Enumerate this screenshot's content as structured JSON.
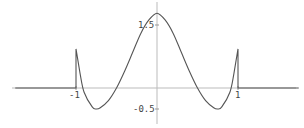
{
  "chart_data": {
    "type": "line",
    "title": "",
    "xlabel": "",
    "ylabel": "",
    "xlim": [
      -1.85,
      1.75
    ],
    "ylim": [
      -0.65,
      1.85
    ],
    "grid": false,
    "legend": null,
    "x_ticks": [
      {
        "value": -1,
        "label": "-1"
      },
      {
        "value": 1,
        "label": "1"
      }
    ],
    "y_ticks": [
      {
        "value": 1.5,
        "label": "1.5"
      },
      {
        "value": -0.5,
        "label": "-0.5"
      }
    ],
    "series": [
      {
        "name": "f(x)",
        "color": "#555555",
        "x": [
          -1.75,
          -1.0,
          -1.0,
          -0.95,
          -0.9,
          -0.8,
          -0.75,
          -0.7,
          -0.6,
          -0.5,
          -0.4,
          -0.3,
          -0.2,
          -0.1,
          0.0,
          0.1,
          0.2,
          0.3,
          0.4,
          0.5,
          0.6,
          0.7,
          0.75,
          0.8,
          0.9,
          0.95,
          1.0,
          1.0,
          1.75
        ],
        "y": [
          0,
          0,
          0.93,
          0.35,
          -0.1,
          -0.45,
          -0.5,
          -0.47,
          -0.3,
          0.0,
          0.4,
          0.85,
          1.3,
          1.62,
          1.78,
          1.62,
          1.3,
          0.85,
          0.4,
          0.0,
          -0.3,
          -0.47,
          -0.5,
          -0.45,
          -0.1,
          0.35,
          0.93,
          0,
          0
        ]
      }
    ]
  }
}
